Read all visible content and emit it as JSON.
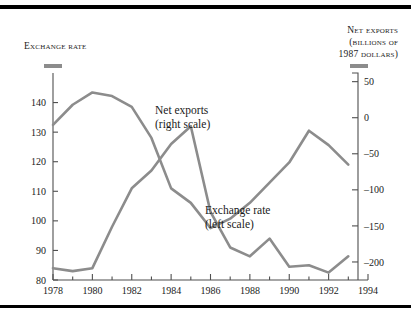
{
  "figure": {
    "left_heading": "Exchange rate",
    "right_heading_line1": "Net exports",
    "right_heading_line2": "(billions of",
    "right_heading_line3": "1987 dollars)",
    "swatch_color": "#8c8c8c",
    "line_color": "#8c8c8c",
    "axis_color": "#4f4f4f",
    "rule_color": "#000000",
    "background": "#ffffff"
  },
  "annotations": {
    "net_exports_l1": "Net exports",
    "net_exports_l2": "(right scale)",
    "exchange_rate_l1": "Exchange rate",
    "exchange_rate_l2": "(left scale)"
  },
  "chart_data": {
    "type": "line",
    "title": "",
    "xlabel": "",
    "grid": false,
    "legend": "inline-annotations",
    "x": [
      1978,
      1979,
      1980,
      1981,
      1982,
      1983,
      1984,
      1985,
      1986,
      1987,
      1988,
      1989,
      1990,
      1991,
      1992,
      1993
    ],
    "xlim": [
      1978,
      1994
    ],
    "x_tick_labels": [
      "1978",
      "1980",
      "1982",
      "1984",
      "1986",
      "1988",
      "1990",
      "1992",
      "1994"
    ],
    "x_tick_values": [
      1978,
      1980,
      1982,
      1984,
      1986,
      1988,
      1990,
      1992,
      1994
    ],
    "x_minor_tick_values": [
      1979,
      1981,
      1983,
      1985,
      1987,
      1989,
      1991,
      1993
    ],
    "left_axis": {
      "label": "Exchange rate",
      "ylim": [
        80,
        150
      ],
      "tick_labels": [
        "140",
        "130",
        "120",
        "110",
        "100",
        "90",
        "80"
      ],
      "tick_values": [
        140,
        130,
        120,
        110,
        100,
        90,
        80
      ]
    },
    "right_axis": {
      "label": "Net exports (billions of 1987 dollars)",
      "ylim": [
        -225,
        62
      ],
      "tick_labels": [
        "50",
        "0",
        "–50",
        "–100",
        "–150",
        "–200"
      ],
      "tick_values": [
        50,
        0,
        -50,
        -100,
        -150,
        -200
      ]
    },
    "series": [
      {
        "name": "Exchange rate (left scale)",
        "axis": "left",
        "values": [
          84,
          83,
          84,
          98,
          111,
          117,
          126,
          132,
          103,
          91,
          88,
          94,
          84.5,
          85,
          82.5,
          88
        ]
      },
      {
        "name": "Net exports (right scale)",
        "axis": "right",
        "values": [
          -10,
          18,
          35,
          30,
          15,
          -28,
          -98,
          -118,
          -153,
          -140,
          -118,
          -90,
          -62,
          -18,
          -38,
          -65
        ]
      }
    ]
  }
}
